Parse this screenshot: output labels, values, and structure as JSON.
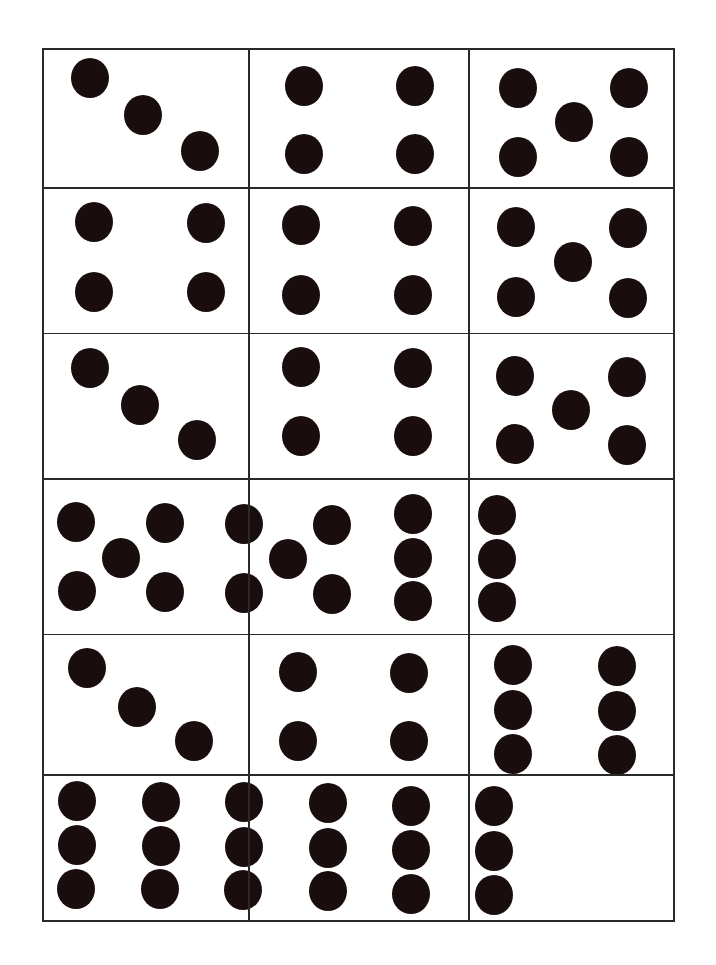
{
  "sheet": {
    "title": "",
    "grid": {
      "columns_x": [
        42,
        248,
        468,
        673
      ],
      "rows_y": [
        48,
        187,
        332,
        477,
        632,
        772,
        918
      ],
      "line_color": "#2a2a2a",
      "dot_color": "#1a0d0d"
    },
    "cards": [
      {
        "row": 0,
        "col": 0,
        "count": 3,
        "pattern": "diagonal-3",
        "dots": [
          [
            90,
            78
          ],
          [
            143,
            115
          ],
          [
            200,
            151
          ]
        ]
      },
      {
        "row": 0,
        "col": 1,
        "count": 4,
        "pattern": "square-4",
        "dots": [
          [
            304,
            86
          ],
          [
            415,
            86
          ],
          [
            304,
            154
          ],
          [
            415,
            154
          ]
        ]
      },
      {
        "row": 0,
        "col": 2,
        "count": 5,
        "pattern": "quincunx-5",
        "dots": [
          [
            518,
            88
          ],
          [
            629,
            88
          ],
          [
            574,
            122
          ],
          [
            518,
            157
          ],
          [
            629,
            157
          ]
        ]
      },
      {
        "row": 1,
        "col": 0,
        "count": 4,
        "pattern": "square-4",
        "dots": [
          [
            94,
            222
          ],
          [
            206,
            223
          ],
          [
            94,
            292
          ],
          [
            206,
            292
          ]
        ]
      },
      {
        "row": 1,
        "col": 1,
        "count": 4,
        "pattern": "square-4",
        "dots": [
          [
            301,
            225
          ],
          [
            413,
            226
          ],
          [
            301,
            295
          ],
          [
            413,
            295
          ]
        ]
      },
      {
        "row": 1,
        "col": 2,
        "count": 5,
        "pattern": "quincunx-5",
        "dots": [
          [
            516,
            227
          ],
          [
            628,
            228
          ],
          [
            573,
            262
          ],
          [
            516,
            297
          ],
          [
            628,
            298
          ]
        ]
      },
      {
        "row": 2,
        "col": 0,
        "count": 3,
        "pattern": "diagonal-3",
        "dots": [
          [
            90,
            368
          ],
          [
            140,
            405
          ],
          [
            197,
            440
          ]
        ]
      },
      {
        "row": 2,
        "col": 1,
        "count": 4,
        "pattern": "square-4",
        "dots": [
          [
            301,
            367
          ],
          [
            413,
            368
          ],
          [
            301,
            436
          ],
          [
            413,
            436
          ]
        ]
      },
      {
        "row": 2,
        "col": 2,
        "count": 5,
        "pattern": "quincunx-5",
        "dots": [
          [
            515,
            376
          ],
          [
            627,
            377
          ],
          [
            571,
            410
          ],
          [
            515,
            444
          ],
          [
            627,
            445
          ]
        ]
      },
      {
        "row": 3,
        "col": 0,
        "count": 5,
        "pattern": "quincunx-5",
        "dots": [
          [
            76,
            522
          ],
          [
            165,
            523
          ],
          [
            121,
            558
          ],
          [
            77,
            591
          ],
          [
            165,
            592
          ]
        ]
      },
      {
        "row": 3,
        "col": 1,
        "count": 5,
        "pattern": "quincunx-5",
        "dots": [
          [
            244,
            524
          ],
          [
            332,
            525
          ],
          [
            288,
            559
          ],
          [
            244,
            593
          ],
          [
            332,
            594
          ]
        ]
      },
      {
        "row": 3,
        "col": 2,
        "count": 6,
        "pattern": "column-6",
        "dots": [
          [
            413,
            514
          ],
          [
            497,
            515
          ],
          [
            413,
            558
          ],
          [
            497,
            559
          ],
          [
            413,
            601
          ],
          [
            497,
            602
          ]
        ]
      },
      {
        "row": 4,
        "col": 0,
        "count": 3,
        "pattern": "diagonal-3",
        "dots": [
          [
            87,
            668
          ],
          [
            137,
            707
          ],
          [
            194,
            741
          ]
        ]
      },
      {
        "row": 4,
        "col": 1,
        "count": 4,
        "pattern": "square-4",
        "dots": [
          [
            298,
            672
          ],
          [
            409,
            673
          ],
          [
            298,
            741
          ],
          [
            409,
            741
          ]
        ]
      },
      {
        "row": 4,
        "col": 2,
        "count": 6,
        "pattern": "column-6",
        "dots": [
          [
            513,
            665
          ],
          [
            617,
            666
          ],
          [
            513,
            710
          ],
          [
            617,
            711
          ],
          [
            513,
            754
          ],
          [
            617,
            755
          ]
        ]
      },
      {
        "row": 5,
        "col": 0,
        "count": 6,
        "pattern": "column-6",
        "dots": [
          [
            77,
            801
          ],
          [
            161,
            802
          ],
          [
            77,
            845
          ],
          [
            161,
            846
          ],
          [
            76,
            889
          ],
          [
            160,
            889
          ]
        ]
      },
      {
        "row": 5,
        "col": 1,
        "count": 6,
        "pattern": "column-6",
        "dots": [
          [
            244,
            802
          ],
          [
            328,
            803
          ],
          [
            244,
            847
          ],
          [
            328,
            848
          ],
          [
            243,
            890
          ],
          [
            328,
            891
          ]
        ]
      },
      {
        "row": 5,
        "col": 2,
        "count": 6,
        "pattern": "column-6",
        "dots": [
          [
            411,
            806
          ],
          [
            494,
            806
          ],
          [
            411,
            850
          ],
          [
            494,
            851
          ],
          [
            411,
            894
          ],
          [
            494,
            895
          ]
        ]
      }
    ]
  }
}
